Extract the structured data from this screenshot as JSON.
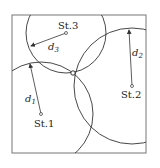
{
  "diagram": {
    "type": "trilateration",
    "frame": {
      "x": 12,
      "y": 15,
      "width": 134,
      "height": 138,
      "stroke": "#777777"
    },
    "stroke_color": "#333333",
    "stations": [
      {
        "id": "st1",
        "label": "St.1",
        "cx": 41,
        "cy": 114,
        "r": 52,
        "distance_label": "d",
        "distance_sub": "1",
        "arrow_to": [
          30,
          63
        ]
      },
      {
        "id": "st2",
        "label": "St.2",
        "cx": 132,
        "cy": 86,
        "r": 58,
        "distance_label": "d",
        "distance_sub": "2",
        "arrow_to": [
          129,
          29
        ]
      },
      {
        "id": "st3",
        "label": "St.3",
        "cx": 66,
        "cy": 33,
        "r": 40,
        "distance_label": "d",
        "distance_sub": "3",
        "arrow_to": [
          30,
          46
        ]
      }
    ],
    "intersection": {
      "x": 73,
      "y": 73
    }
  }
}
